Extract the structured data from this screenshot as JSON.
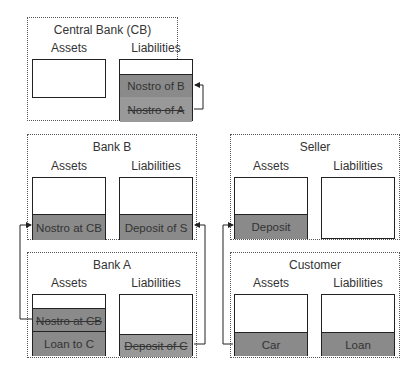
{
  "entities": {
    "central_bank": {
      "title": "Central Bank (CB)",
      "assets_label": "Assets",
      "liabilities_label": "Liabilities",
      "liabilities": [
        "Nostro of B",
        "Nostro of A"
      ]
    },
    "bank_b": {
      "title": "Bank B",
      "assets_label": "Assets",
      "liabilities_label": "Liabilities",
      "assets": [
        "Nostro at CB"
      ],
      "liabilities": [
        "Deposit of S"
      ]
    },
    "bank_a": {
      "title": "Bank A",
      "assets_label": "Assets",
      "liabilities_label": "Liabilities",
      "assets": [
        "Nostro at CB",
        "Loan to C"
      ],
      "liabilities": [
        "Deposit of C"
      ]
    },
    "seller": {
      "title": "Seller",
      "assets_label": "Assets",
      "liabilities_label": "Liabilities",
      "assets": [
        "Deposit"
      ]
    },
    "customer": {
      "title": "Customer",
      "assets_label": "Assets",
      "liabilities_label": "Liabilities",
      "assets": [
        "Car"
      ],
      "liabilities": [
        "Loan"
      ]
    }
  },
  "colors": {
    "filled_segment": "#8a8a8a",
    "frame_border": "#555555",
    "box_border": "#222222"
  }
}
